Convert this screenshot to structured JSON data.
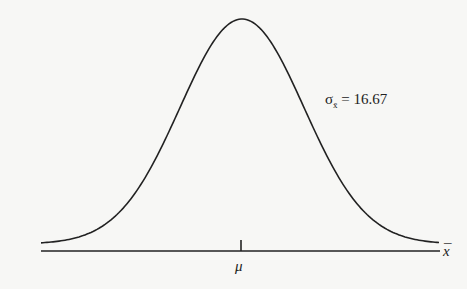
{
  "chart_data": {
    "type": "line",
    "title": "",
    "xlabel": "x̄",
    "ylabel": "",
    "tick_labels": [
      "μ"
    ],
    "annotation": {
      "symbol": "σ",
      "subscript": "x̄",
      "equals": "=",
      "value": "16.67"
    },
    "parameters": {
      "mean": "μ",
      "std_error": 16.67
    },
    "grid": false,
    "legend": null
  },
  "labels": {
    "sigma_symbol": "σ",
    "sigma_subscript": "x̄",
    "sigma_text": " =  16.67",
    "mu": "μ",
    "xbar": "x",
    "xbar_bar": "¯"
  },
  "colors": {
    "curve": "#222222",
    "axis": "#222222",
    "background": "#f7f7f5"
  }
}
